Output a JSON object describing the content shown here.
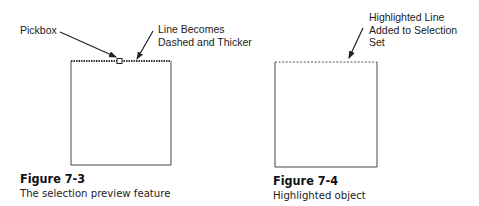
{
  "figures": [
    {
      "number": "Figure 7-3",
      "caption": "The selection preview feature",
      "callouts": [
        {
          "text_lines": [
            "Pickbox"
          ]
        },
        {
          "text_lines": [
            "Line Becomes",
            "Dashed and Thicker"
          ]
        }
      ]
    },
    {
      "number": "Figure 7-4",
      "caption": "Highlighted object",
      "callouts": [
        {
          "text_lines": [
            "Highlighted Line",
            "Added to Selection",
            "Set"
          ]
        }
      ]
    }
  ],
  "colors": {
    "line": "#333333",
    "background": "#ffffff"
  }
}
